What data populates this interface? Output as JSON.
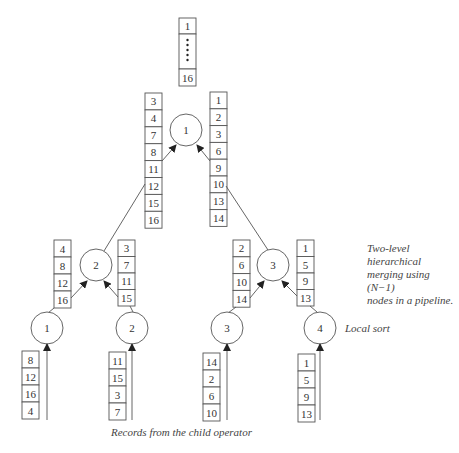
{
  "caption": {
    "line1": "Two-level hierarchical",
    "line2": "merging using (N−1)",
    "line3": "nodes in a pipeline."
  },
  "labels": {
    "local_sort": "Local sort",
    "records_from_child": "Records from the child operator"
  },
  "output": {
    "first": "1",
    "last": "16",
    "ellipsis": "vertical-dots"
  },
  "root": {
    "label": "1",
    "left_input": [
      "3",
      "4",
      "7",
      "8",
      "11",
      "12",
      "15",
      "16"
    ],
    "right_input": [
      "1",
      "2",
      "3",
      "6",
      "9",
      "10",
      "13",
      "14"
    ]
  },
  "merge_nodes": [
    {
      "label": "2",
      "left_input": [
        "4",
        "8",
        "12",
        "16"
      ],
      "right_input": [
        "3",
        "7",
        "11",
        "15"
      ]
    },
    {
      "label": "3",
      "left_input": [
        "2",
        "6",
        "10",
        "14"
      ],
      "right_input": [
        "1",
        "5",
        "9",
        "13"
      ]
    }
  ],
  "leaf_nodes": [
    {
      "label": "1",
      "input": [
        "8",
        "12",
        "16",
        "4"
      ]
    },
    {
      "label": "2",
      "input": [
        "11",
        "15",
        "3",
        "7"
      ]
    },
    {
      "label": "3",
      "input": [
        "14",
        "2",
        "6",
        "10"
      ]
    },
    {
      "label": "4",
      "input": [
        "1",
        "5",
        "9",
        "13"
      ]
    }
  ]
}
